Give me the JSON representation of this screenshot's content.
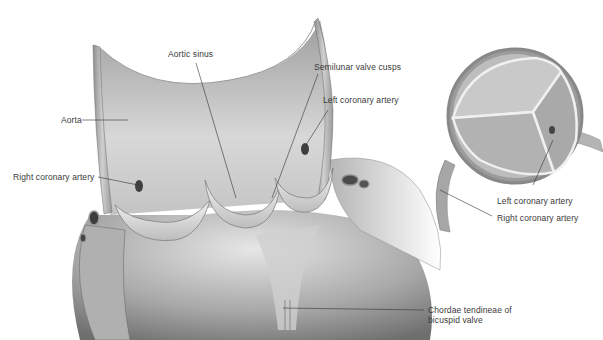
{
  "figure": {
    "colors": {
      "background": "#ffffff",
      "tissue_light": "#e4e4e4",
      "tissue_mid": "#b9b9b9",
      "tissue_dark": "#7a7a7a",
      "label_text": "#3a3a3a",
      "leader_line": "#333333"
    }
  },
  "labels": [
    {
      "id": "aorta",
      "text": "Aorta",
      "x": 61,
      "y": 115
    },
    {
      "id": "aortic-sinus",
      "text": "Aortic sinus",
      "x": 168,
      "y": 49
    },
    {
      "id": "semilunar-valve-cusps",
      "text": "Semilunar valve cusps",
      "x": 314,
      "y": 62
    },
    {
      "id": "left-coronary-artery-main",
      "text": "Left coronary artery",
      "x": 323,
      "y": 95
    },
    {
      "id": "right-coronary-artery-main",
      "text": "Right coronary artery",
      "x": 13,
      "y": 172
    },
    {
      "id": "left-coronary-artery-inset",
      "text": "Left coronary artery",
      "x": 497,
      "y": 196
    },
    {
      "id": "right-coronary-artery-inset",
      "text": "Right coronary artery",
      "x": 497,
      "y": 213
    },
    {
      "id": "chordae-tendineae",
      "text": "Chordae tendineae of",
      "text2": "bicuspid valve",
      "x": 428,
      "y": 307
    }
  ]
}
